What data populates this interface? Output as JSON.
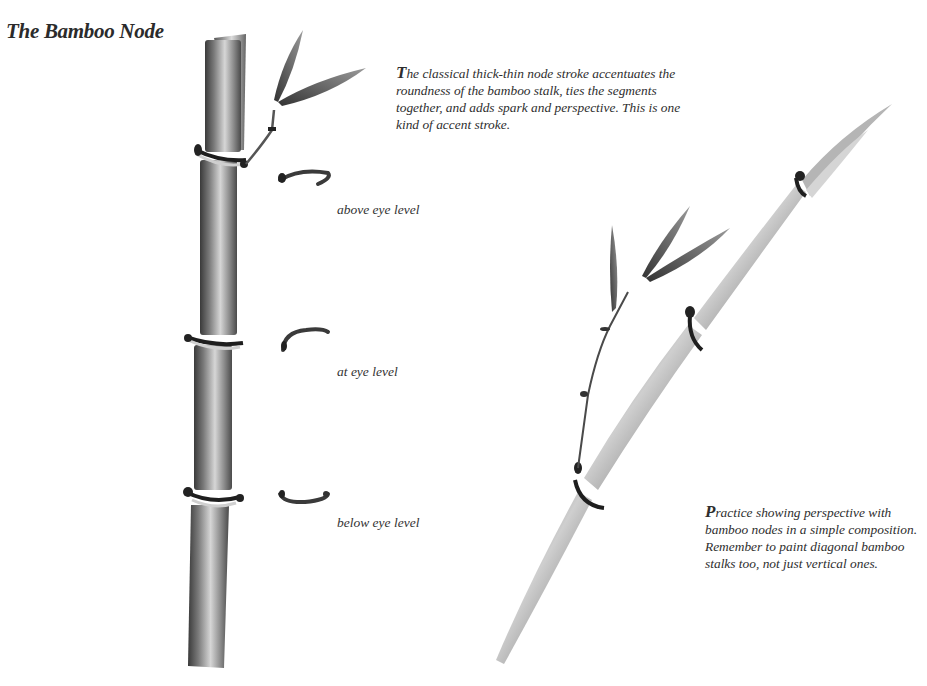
{
  "page": {
    "title": "The Bamboo Node",
    "intro_caption": {
      "dropcap": "T",
      "text": "he classical thick-thin node stroke accentuates the roundness of the bamboo stalk, ties the segments together, and adds spark and perspective. This is one kind of accent stroke."
    },
    "node_examples": [
      {
        "label": "above eye level"
      },
      {
        "label": "at eye level"
      },
      {
        "label": "below eye level"
      }
    ],
    "practice_caption": {
      "dropcap": "P",
      "text": "ractice showing perspective with bamboo nodes in a simple composition. Remember to paint diagonal bamboo stalks too, not just vertical ones."
    },
    "colors": {
      "ink_dark": "#1e1e1e",
      "ink_mid": "#6e6e6e",
      "ink_light": "#c4c4c4",
      "paper": "#ffffff"
    }
  }
}
